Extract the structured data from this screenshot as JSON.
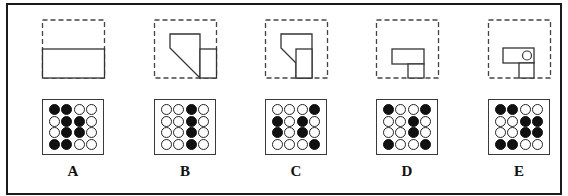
{
  "figure": {
    "type": "visual-reasoning-options",
    "options": [
      {
        "label": "A",
        "shape": "half-filled-rectangle",
        "grid": [
          [
            1,
            1,
            0,
            0
          ],
          [
            0,
            1,
            1,
            0
          ],
          [
            0,
            1,
            1,
            0
          ],
          [
            1,
            1,
            0,
            0
          ]
        ]
      },
      {
        "label": "B",
        "shape": "pentagon-with-right-tall-rectangle",
        "grid": [
          [
            0,
            0,
            1,
            0
          ],
          [
            0,
            0,
            1,
            0
          ],
          [
            0,
            0,
            1,
            0
          ],
          [
            0,
            0,
            1,
            0
          ]
        ]
      },
      {
        "label": "C",
        "shape": "small-pentagon-with-tall-rectangle",
        "grid": [
          [
            0,
            0,
            0,
            1
          ],
          [
            1,
            0,
            1,
            0
          ],
          [
            1,
            0,
            1,
            0
          ],
          [
            0,
            0,
            0,
            1
          ]
        ]
      },
      {
        "label": "D",
        "shape": "t-shaped-rectangles",
        "grid": [
          [
            1,
            0,
            0,
            1
          ],
          [
            0,
            0,
            1,
            0
          ],
          [
            0,
            0,
            1,
            0
          ],
          [
            1,
            0,
            0,
            1
          ]
        ]
      },
      {
        "label": "E",
        "shape": "t-shaped-rectangles-with-circle",
        "grid": [
          [
            1,
            1,
            0,
            0
          ],
          [
            0,
            0,
            1,
            1
          ],
          [
            0,
            0,
            1,
            1
          ],
          [
            1,
            1,
            0,
            0
          ]
        ]
      }
    ],
    "colors": {
      "stroke": "#333333",
      "dot_filled": "#111111",
      "dot_empty": "#ffffff",
      "frame": "#1a1a1a"
    }
  }
}
